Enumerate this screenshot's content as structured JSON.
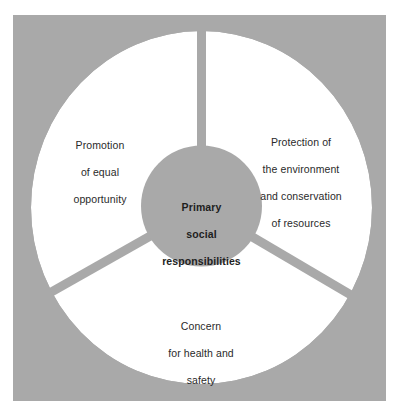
{
  "diagram": {
    "title": "Primary social responsibilities",
    "colors": {
      "background": "#ffffff",
      "frame": "#a9a9a9",
      "sector_fill": "#ffffff",
      "text": "#2a2a2a"
    },
    "center": {
      "lines": [
        "Primary",
        "social",
        "responsibilities"
      ]
    },
    "sectors": [
      {
        "id": "equal-opportunity",
        "position": "upper-left",
        "lines": [
          "Promotion",
          "of equal",
          "opportunity"
        ]
      },
      {
        "id": "environment",
        "position": "upper-right",
        "lines": [
          "Protection of",
          "the environment",
          "and conservation",
          "of resources"
        ]
      },
      {
        "id": "health-safety",
        "position": "bottom",
        "lines": [
          "Concern",
          "for health and",
          "safety"
        ]
      }
    ]
  }
}
